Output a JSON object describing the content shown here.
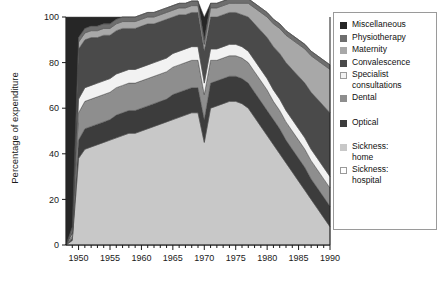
{
  "chart_data": {
    "type": "area",
    "title": "",
    "xlabel": "",
    "ylabel": "Percentage of expenditure",
    "xlim": [
      1948,
      1990
    ],
    "ylim": [
      0,
      100
    ],
    "grid": false,
    "stacked": true,
    "stack_order": "bottom-to-top",
    "legend_position": "right",
    "x_major_ticks": [
      1950,
      1955,
      1960,
      1965,
      1970,
      1975,
      1980,
      1985,
      1990
    ],
    "x_minor_tick_step": 1,
    "y_ticks": [
      0,
      20,
      40,
      60,
      80,
      100
    ],
    "x_tick_labels": [
      "1950",
      "1955",
      "1960",
      "1965",
      "1970",
      "1975",
      "1980",
      "1985",
      "1990"
    ],
    "y_tick_labels": [
      "0",
      "20",
      "40",
      "60",
      "80",
      "100"
    ],
    "x": [
      1948,
      1949,
      1950,
      1951,
      1952,
      1953,
      1954,
      1955,
      1956,
      1957,
      1958,
      1959,
      1960,
      1961,
      1962,
      1963,
      1964,
      1965,
      1966,
      1967,
      1968,
      1969,
      1970,
      1971,
      1972,
      1973,
      1974,
      1975,
      1976,
      1977,
      1978,
      1979,
      1980,
      1981,
      1982,
      1983,
      1984,
      1985,
      1986,
      1987,
      1988,
      1989,
      1990
    ],
    "series": [
      {
        "name": "Sickness: hospital",
        "color": "#ffffff",
        "values": [
          0,
          0,
          0,
          0,
          0,
          0,
          0,
          0,
          0,
          0,
          0,
          0,
          0,
          0,
          0,
          0,
          0,
          0,
          0,
          0,
          0,
          0,
          0,
          0,
          0,
          0,
          0,
          0,
          0,
          0,
          0,
          0,
          0,
          0,
          0,
          0,
          0,
          0,
          0,
          0,
          0,
          0,
          0
        ]
      },
      {
        "name": "Sickness: home",
        "color": "#c8c8c8",
        "values": [
          0,
          2,
          38,
          42,
          43,
          44,
          45,
          46,
          47,
          48,
          49,
          49,
          50,
          51,
          52,
          53,
          54,
          55,
          56,
          57,
          58,
          58,
          45,
          60,
          61,
          62,
          63,
          63,
          62,
          60,
          56,
          52,
          48,
          44,
          40,
          36,
          32,
          28,
          24,
          20,
          16,
          12,
          8
        ]
      },
      {
        "name": "Optical",
        "color": "#3c3c3c",
        "values": [
          0,
          1,
          8,
          9,
          9,
          9,
          9,
          9,
          10,
          10,
          10,
          10,
          10,
          10,
          10,
          10,
          10,
          11,
          11,
          11,
          11,
          11,
          10,
          11,
          11,
          11,
          11,
          11,
          11,
          11,
          11,
          11,
          11,
          11,
          11,
          10,
          10,
          10,
          10,
          9,
          9,
          9,
          9
        ]
      },
      {
        "name": "Dental",
        "color": "#8e8e8e",
        "values": [
          0,
          1,
          12,
          12,
          12,
          12,
          12,
          12,
          12,
          12,
          12,
          12,
          12,
          12,
          12,
          12,
          12,
          12,
          12,
          12,
          12,
          12,
          11,
          10,
          9,
          9,
          9,
          9,
          9,
          9,
          9,
          9,
          9,
          8,
          8,
          8,
          8,
          8,
          8,
          8,
          8,
          8,
          8
        ]
      },
      {
        "name": "Specialist consultations",
        "color": "#f2f2f2",
        "values": [
          0,
          1,
          6,
          6,
          6,
          6,
          6,
          6,
          6,
          6,
          6,
          6,
          6,
          6,
          6,
          6,
          6,
          6,
          6,
          6,
          6,
          6,
          5,
          5,
          5,
          5,
          5,
          5,
          5,
          5,
          5,
          5,
          5,
          5,
          5,
          5,
          5,
          5,
          5,
          5,
          5,
          5,
          5
        ]
      },
      {
        "name": "Convalescence",
        "color": "#4a4a4a",
        "values": [
          0,
          1,
          22,
          21,
          21,
          20,
          20,
          19,
          19,
          19,
          18,
          18,
          18,
          18,
          17,
          17,
          17,
          16,
          16,
          15,
          15,
          15,
          14,
          14,
          14,
          14,
          14,
          14,
          14,
          15,
          16,
          17,
          18,
          19,
          20,
          21,
          22,
          23,
          24,
          25,
          26,
          27,
          28
        ]
      },
      {
        "name": "Maternity",
        "color": "#a8a8a8",
        "values": [
          0,
          1,
          3,
          3,
          3,
          3,
          3,
          3,
          3,
          3,
          3,
          3,
          3,
          3,
          3,
          3,
          3,
          3,
          3,
          3,
          3,
          3,
          3,
          4,
          4,
          4,
          4,
          4,
          5,
          6,
          7,
          8,
          9,
          10,
          11,
          12,
          13,
          14,
          15,
          16,
          17,
          18,
          19
        ]
      },
      {
        "name": "Physiotherapy",
        "color": "#6e6e6e",
        "values": [
          0,
          1,
          2,
          2,
          2,
          2,
          2,
          2,
          2,
          2,
          2,
          2,
          2,
          2,
          2,
          2,
          2,
          2,
          2,
          2,
          2,
          2,
          2,
          2,
          2,
          2,
          2,
          2,
          2,
          2,
          2,
          2,
          2,
          2,
          2,
          2,
          2,
          2,
          2,
          2,
          2,
          2,
          2
        ]
      },
      {
        "name": "Miscellaneous",
        "color": "#262626",
        "values": [
          100,
          92,
          9,
          5,
          4,
          4,
          3,
          3,
          1,
          0,
          0,
          0,
          0,
          0,
          0,
          0,
          0,
          0,
          0,
          0,
          0,
          0,
          10,
          0,
          0,
          0,
          0,
          0,
          0,
          0,
          0,
          0,
          0,
          0,
          0,
          0,
          0,
          0,
          0,
          0,
          0,
          0,
          0
        ]
      }
    ]
  },
  "legend": {
    "items": [
      {
        "label": "Miscellaneous",
        "color": "#262626",
        "border": "#262626",
        "gap": false
      },
      {
        "label": "Physiotherapy",
        "color": "#6e6e6e",
        "border": "#6e6e6e",
        "gap": false
      },
      {
        "label": "Maternity",
        "color": "#a8a8a8",
        "border": "#a8a8a8",
        "gap": false
      },
      {
        "label": "Convalescence",
        "color": "#4a4a4a",
        "border": "#4a4a4a",
        "gap": false
      },
      {
        "label": "Specialist\nconsultations",
        "color": "#f2f2f2",
        "border": "#9a9a9a",
        "gap": false
      },
      {
        "label": "Dental",
        "color": "#8e8e8e",
        "border": "#8e8e8e",
        "gap": false
      },
      {
        "label": "Optical",
        "color": "#3c3c3c",
        "border": "#3c3c3c",
        "gap": true
      },
      {
        "label": "Sickness:\nhome",
        "color": "#c8c8c8",
        "border": "#c8c8c8",
        "gap": true
      },
      {
        "label": "Sickness:\nhospital",
        "color": "#ffffff",
        "border": "#9a9a9a",
        "gap": false
      }
    ]
  },
  "axes": {
    "y_title": "Percentage of expenditure"
  }
}
